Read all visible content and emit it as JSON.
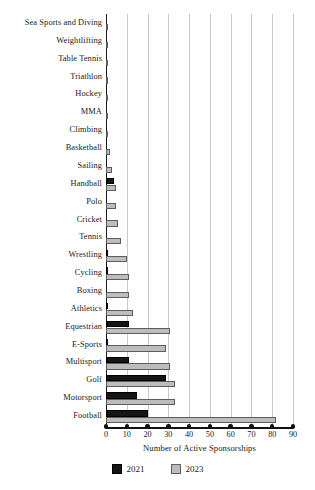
{
  "chart_data": {
    "type": "bar",
    "orientation": "horizontal",
    "title": "",
    "xlabel": "Number of Active Sponsorships",
    "ylabel": "",
    "xlim": [
      0,
      90
    ],
    "xticks": [
      0,
      10,
      20,
      30,
      40,
      50,
      60,
      70,
      80,
      90
    ],
    "grid": true,
    "legend_position": "bottom-center",
    "colors": {
      "2021": "#151515",
      "2023": "#bdbdbd"
    },
    "categories": [
      "Sea Sports and Diving",
      "Weightlifting",
      "Table Tennis",
      "Triathlon",
      "Hockey",
      "MMA",
      "Climbing",
      "Basketball",
      "Sailing",
      "Handball",
      "Polo",
      "Cricket",
      "Tennis",
      "Wrestling",
      "Cycling",
      "Boxing",
      "Athletics",
      "Equestrian",
      "E-Sports",
      "Multisport",
      "Golf",
      "Motorsport",
      "Football"
    ],
    "series": [
      {
        "name": "2021",
        "values": [
          0,
          0,
          0,
          0,
          0,
          0,
          0,
          0,
          0,
          4,
          0,
          0,
          0,
          1,
          1,
          0,
          1,
          11,
          1,
          11,
          29,
          15,
          20
        ]
      },
      {
        "name": "2023",
        "values": [
          1,
          1,
          1,
          1,
          1,
          1,
          1,
          2,
          3,
          5,
          5,
          6,
          7,
          10,
          11,
          11,
          13,
          31,
          29,
          31,
          33,
          33,
          82
        ]
      }
    ]
  },
  "legend": {
    "items": [
      {
        "label": "2021",
        "color": "#151515"
      },
      {
        "label": "2023",
        "color": "#bdbdbd"
      }
    ]
  }
}
